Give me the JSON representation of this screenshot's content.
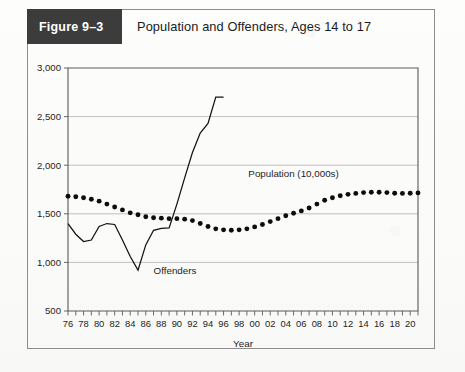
{
  "figure": {
    "badge": "Figure 9–3",
    "title": "Population and Offenders, Ages 14 to 17"
  },
  "labels": {
    "offenders": "Offenders",
    "population": "Population (10,000s)"
  },
  "colors": {
    "badge_bg": "#3c3c3c",
    "badge_text": "#ffffff",
    "frame_border": "#8d8d8d",
    "gridline": "#b9b9b9",
    "axis": "#5a5a5a",
    "series_ink": "#121212",
    "page_bg": "#fbfbfa"
  },
  "chart_data": {
    "type": "line",
    "title": "Population and Offenders, Ages 14 to 17",
    "xlabel": "Year",
    "ylabel": "",
    "xlim": [
      1976,
      2021
    ],
    "ylim": [
      500,
      3000
    ],
    "yticks": [
      500,
      1000,
      1500,
      2000,
      2500,
      3000
    ],
    "ytick_labels": [
      "500",
      "1,000",
      "1,500",
      "2,000",
      "2,500",
      "3,000"
    ],
    "grid": true,
    "legend": "inline-annotation",
    "xticks": [
      1976,
      1977,
      1978,
      1979,
      1980,
      1981,
      1982,
      1983,
      1984,
      1985,
      1986,
      1987,
      1988,
      1989,
      1990,
      1991,
      1992,
      1993,
      1994,
      1995,
      1996,
      1997,
      1998,
      1999,
      2000,
      2001,
      2002,
      2003,
      2004,
      2005,
      2006,
      2007,
      2008,
      2009,
      2010,
      2011,
      2012,
      2013,
      2014,
      2015,
      2016,
      2017,
      2018,
      2019,
      2020,
      2021
    ],
    "xtick_labels": [
      "76",
      "",
      "78",
      "",
      "80",
      "",
      "82",
      "",
      "84",
      "",
      "86",
      "",
      "88",
      "",
      "90",
      "",
      "92",
      "",
      "94",
      "",
      "96",
      "",
      "98",
      "",
      "00",
      "",
      "02",
      "",
      "04",
      "",
      "06",
      "",
      "08",
      "",
      "10",
      "",
      "12",
      "",
      "14",
      "",
      "16",
      "",
      "18",
      "",
      "20",
      ""
    ],
    "series": [
      {
        "name": "Population (10,000s)",
        "style": "dotted-markers",
        "x": [
          1976,
          1977,
          1978,
          1979,
          1980,
          1981,
          1982,
          1983,
          1984,
          1985,
          1986,
          1987,
          1988,
          1989,
          1990,
          1991,
          1992,
          1993,
          1994,
          1995,
          1996,
          1997,
          1998,
          1999,
          2000,
          2001,
          2002,
          2003,
          2004,
          2005,
          2006,
          2007,
          2008,
          2009,
          2010,
          2011,
          2012,
          2013,
          2014,
          2015,
          2016,
          2017,
          2018,
          2019,
          2020,
          2021
        ],
        "values": [
          1680,
          1675,
          1665,
          1650,
          1630,
          1600,
          1570,
          1540,
          1510,
          1490,
          1470,
          1460,
          1455,
          1450,
          1450,
          1445,
          1430,
          1400,
          1370,
          1345,
          1335,
          1330,
          1335,
          1345,
          1365,
          1390,
          1420,
          1450,
          1480,
          1505,
          1530,
          1560,
          1600,
          1640,
          1665,
          1685,
          1700,
          1710,
          1718,
          1722,
          1722,
          1718,
          1712,
          1710,
          1712,
          1715
        ]
      },
      {
        "name": "Offenders",
        "style": "solid-line",
        "x": [
          1976,
          1977,
          1978,
          1979,
          1980,
          1981,
          1982,
          1983,
          1984,
          1985,
          1986,
          1987,
          1988,
          1989,
          1990,
          1991,
          1992,
          1993,
          1994,
          1995,
          1996
        ],
        "values": [
          1400,
          1290,
          1215,
          1230,
          1370,
          1400,
          1390,
          1230,
          1060,
          920,
          1180,
          1330,
          1350,
          1355,
          1600,
          1870,
          2130,
          2330,
          2430,
          2700,
          2700
        ]
      }
    ],
    "annotations": [
      {
        "text": "Offenders",
        "x": 1987,
        "y": 880
      },
      {
        "text": "Population (10,000s)",
        "x": 2005,
        "y": 1880
      }
    ]
  }
}
